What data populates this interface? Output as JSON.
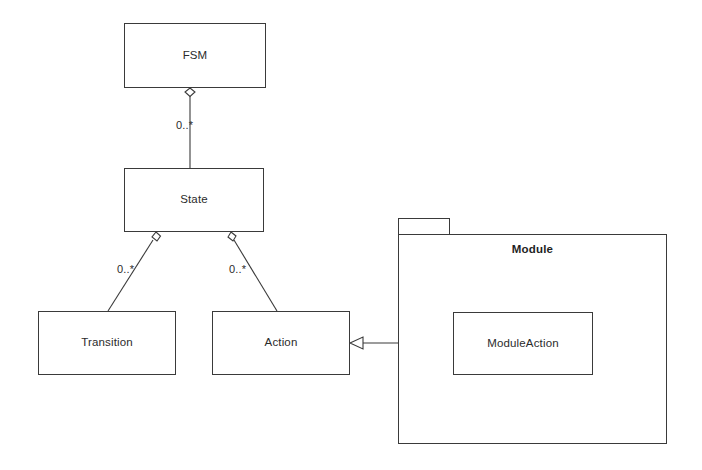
{
  "diagram": {
    "kind": "uml-class-diagram",
    "stroke_color": "#3a3a3a",
    "text_color": "#2b2b2b",
    "background_color": "#ffffff",
    "classes": [
      {
        "id": "fsm",
        "label": "FSM"
      },
      {
        "id": "state",
        "label": "State"
      },
      {
        "id": "transition",
        "label": "Transition"
      },
      {
        "id": "action",
        "label": "Action"
      },
      {
        "id": "module_action",
        "label": "ModuleAction"
      }
    ],
    "package": {
      "id": "module",
      "label": "Module"
    },
    "relationships": [
      {
        "id": "fsm_state",
        "type": "aggregation",
        "from": "FSM",
        "to": "State",
        "target_multiplicity": "0..*"
      },
      {
        "id": "state_transition",
        "type": "aggregation",
        "from": "State",
        "to": "Transition",
        "target_multiplicity": "0..*"
      },
      {
        "id": "state_action",
        "type": "aggregation",
        "from": "State",
        "to": "Action",
        "target_multiplicity": "0..*"
      },
      {
        "id": "moduleaction_action",
        "type": "generalization",
        "from": "ModuleAction",
        "to": "Action",
        "target_multiplicity": ""
      }
    ],
    "multiplicity_labels": {
      "fsm_to_state": "0..*",
      "state_to_transition": "0..*",
      "state_to_action": "0..*"
    }
  }
}
